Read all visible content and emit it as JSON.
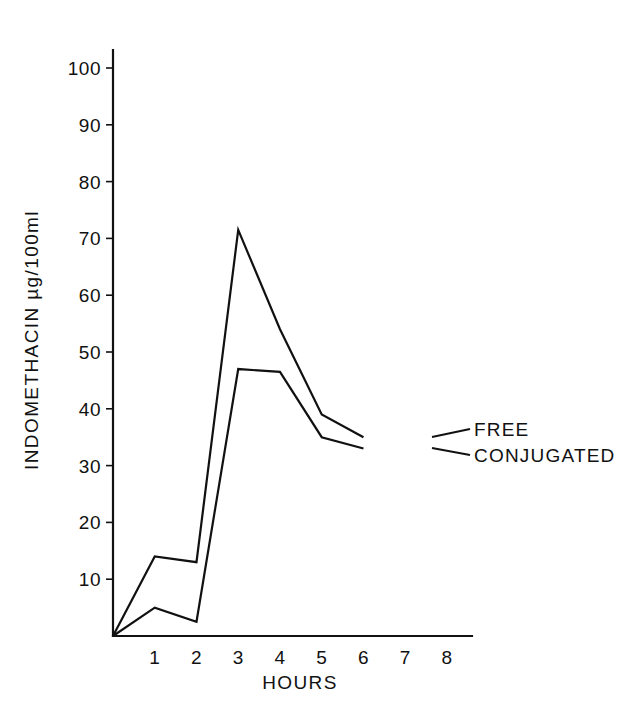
{
  "chart_data": {
    "type": "line",
    "title": "",
    "xlabel": "HOURS",
    "ylabel": "INDOMETHACIN µg/100ml",
    "xlim": [
      0,
      8.6
    ],
    "ylim": [
      0,
      104
    ],
    "xticks": [
      1,
      2,
      3,
      4,
      5,
      6,
      7,
      8
    ],
    "xtick_labels": [
      "1",
      "2",
      "3",
      "4",
      "5",
      "6",
      "7",
      "8"
    ],
    "yticks": [
      10,
      20,
      30,
      40,
      50,
      60,
      70,
      80,
      90,
      100
    ],
    "ytick_labels": [
      "10",
      "20",
      "30",
      "40",
      "50",
      "60",
      "70",
      "80",
      "90",
      "100"
    ],
    "grid": false,
    "legend_position": "inline-right-annotations",
    "x": [
      0,
      1,
      2,
      3,
      4,
      5,
      6
    ],
    "series": [
      {
        "name": "FREE",
        "label": "FREE",
        "color": "#111111",
        "values": [
          0,
          14,
          13,
          71.5,
          54,
          39,
          35
        ]
      },
      {
        "name": "CONJUGATED",
        "label": "CONJUGATED",
        "color": "#111111",
        "values": [
          0,
          5,
          2.5,
          47,
          46.5,
          35,
          33
        ]
      }
    ],
    "annotations": [
      {
        "text": "FREE",
        "x": 6.55,
        "y": 36.5
      },
      {
        "text": "CONJUGATED",
        "x": 6.55,
        "y": 31.0
      }
    ]
  },
  "figure": {
    "background_color": "#ffffff",
    "line_color": "#111111"
  }
}
